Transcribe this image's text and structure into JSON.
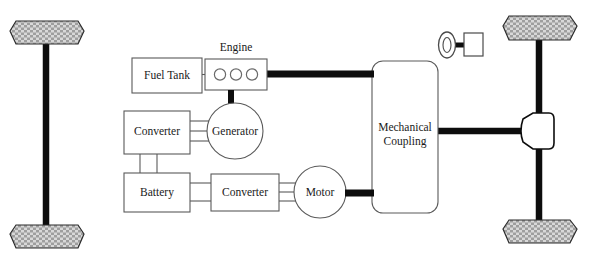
{
  "diagram": {
    "blocks": {
      "fuel_tank": "Fuel Tank",
      "engine": "Engine",
      "generator": "Generator",
      "converter_ac": "Converter",
      "battery": "Battery",
      "converter_dc": "Converter",
      "motor": "Motor",
      "mechanical_coupling_line1": "Mechanical",
      "mechanical_coupling_line2": "Coupling"
    },
    "icons": {
      "steering_wheel": "steering-wheel-icon",
      "differential": "differential-icon",
      "engine_cylinders": "engine-cylinder-icon",
      "wheel_front_left": "wheel-icon",
      "wheel_rear_left": "wheel-icon",
      "wheel_front_right": "wheel-icon",
      "wheel_rear_right": "wheel-icon"
    },
    "colors": {
      "background": "#ffffff",
      "block_stroke": "#5a5a5a",
      "mechanical_shaft": "#0d0d0d",
      "electrical_wire": "#5a5a5a",
      "label_text": "#1a1a1a",
      "wheel_tread": "#b9b9b9"
    },
    "connections": {
      "fuel_tank_to_engine": "fuel-line",
      "engine_to_coupling": "mechanical-shaft",
      "engine_to_generator": "mechanical-shaft",
      "generator_to_converter": "three-phase-ac",
      "converter_to_battery": "dc-bus",
      "battery_to_converter_dc": "dc-bus",
      "converter_dc_to_motor": "three-phase-ac",
      "motor_to_coupling": "mechanical-shaft",
      "coupling_to_differential": "drive-shaft"
    }
  }
}
